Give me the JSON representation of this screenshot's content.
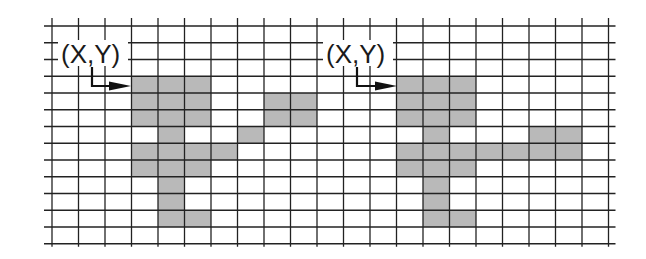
{
  "diagram": {
    "title": "",
    "grid": {
      "columns": 21,
      "rows": 13,
      "origin_x": 52,
      "origin_y": 26,
      "cell_width": 26.5,
      "cell_height": 16.75,
      "line_extend_left": 8,
      "line_extend_right": 7,
      "line_extend_top": 8,
      "line_extend_bottom": 3,
      "line_color": "#222222",
      "fill_color": "#b9b9b9"
    },
    "shapes": [
      {
        "name": "left-shape",
        "label": "(X,Y)",
        "label_x": 61,
        "label_y": 63,
        "label_box": [
          58,
          40,
          70,
          26
        ],
        "arrow": {
          "start": [
            92,
            67
          ],
          "corner": [
            92,
            86
          ],
          "end": [
            131,
            86
          ]
        },
        "cells": [
          [
            3,
            3
          ],
          [
            4,
            3
          ],
          [
            5,
            3
          ],
          [
            3,
            4
          ],
          [
            4,
            4
          ],
          [
            5,
            4
          ],
          [
            8,
            4
          ],
          [
            9,
            4
          ],
          [
            3,
            5
          ],
          [
            4,
            5
          ],
          [
            5,
            5
          ],
          [
            8,
            5
          ],
          [
            9,
            5
          ],
          [
            4,
            6
          ],
          [
            7,
            6
          ],
          [
            3,
            7
          ],
          [
            4,
            7
          ],
          [
            5,
            7
          ],
          [
            6,
            7
          ],
          [
            3,
            8
          ],
          [
            4,
            8
          ],
          [
            5,
            8
          ],
          [
            4,
            9
          ],
          [
            4,
            10
          ],
          [
            4,
            11
          ],
          [
            5,
            11
          ]
        ]
      },
      {
        "name": "right-shape",
        "label": "(X,Y)",
        "label_x": 326,
        "label_y": 63,
        "label_box": [
          323,
          40,
          70,
          26
        ],
        "arrow": {
          "start": [
            357,
            67
          ],
          "corner": [
            357,
            86
          ],
          "end": [
            397,
            86
          ]
        },
        "cells": [
          [
            13,
            3
          ],
          [
            14,
            3
          ],
          [
            15,
            3
          ],
          [
            13,
            4
          ],
          [
            14,
            4
          ],
          [
            15,
            4
          ],
          [
            13,
            5
          ],
          [
            14,
            5
          ],
          [
            15,
            5
          ],
          [
            14,
            6
          ],
          [
            18,
            6
          ],
          [
            19,
            6
          ],
          [
            13,
            7
          ],
          [
            14,
            7
          ],
          [
            15,
            7
          ],
          [
            16,
            7
          ],
          [
            17,
            7
          ],
          [
            18,
            7
          ],
          [
            19,
            7
          ],
          [
            13,
            8
          ],
          [
            14,
            8
          ],
          [
            15,
            8
          ],
          [
            14,
            9
          ],
          [
            14,
            10
          ],
          [
            14,
            11
          ],
          [
            15,
            11
          ]
        ]
      }
    ]
  },
  "chart_data": {
    "type": "heatmap",
    "title": "",
    "xlabel": "",
    "ylabel": "",
    "grid_columns": 21,
    "grid_rows": 13,
    "annotations": [
      {
        "text": "(X,Y)",
        "points_to_cell": [
          3,
          3
        ],
        "arrow": "right"
      },
      {
        "text": "(X,Y)",
        "points_to_cell": [
          13,
          3
        ],
        "arrow": "right"
      }
    ],
    "series": [
      {
        "name": "left-shape",
        "filled_cells_col_row": [
          [
            3,
            3
          ],
          [
            4,
            3
          ],
          [
            5,
            3
          ],
          [
            3,
            4
          ],
          [
            4,
            4
          ],
          [
            5,
            4
          ],
          [
            8,
            4
          ],
          [
            9,
            4
          ],
          [
            3,
            5
          ],
          [
            4,
            5
          ],
          [
            5,
            5
          ],
          [
            8,
            5
          ],
          [
            9,
            5
          ],
          [
            4,
            6
          ],
          [
            7,
            6
          ],
          [
            3,
            7
          ],
          [
            4,
            7
          ],
          [
            5,
            7
          ],
          [
            6,
            7
          ],
          [
            3,
            8
          ],
          [
            4,
            8
          ],
          [
            5,
            8
          ],
          [
            4,
            9
          ],
          [
            4,
            10
          ],
          [
            4,
            11
          ],
          [
            5,
            11
          ]
        ]
      },
      {
        "name": "right-shape",
        "filled_cells_col_row": [
          [
            13,
            3
          ],
          [
            14,
            3
          ],
          [
            15,
            3
          ],
          [
            13,
            4
          ],
          [
            14,
            4
          ],
          [
            15,
            4
          ],
          [
            13,
            5
          ],
          [
            14,
            5
          ],
          [
            15,
            5
          ],
          [
            14,
            6
          ],
          [
            18,
            6
          ],
          [
            19,
            6
          ],
          [
            13,
            7
          ],
          [
            14,
            7
          ],
          [
            15,
            7
          ],
          [
            16,
            7
          ],
          [
            17,
            7
          ],
          [
            18,
            7
          ],
          [
            19,
            7
          ],
          [
            13,
            8
          ],
          [
            14,
            8
          ],
          [
            15,
            8
          ],
          [
            14,
            9
          ],
          [
            14,
            10
          ],
          [
            14,
            11
          ],
          [
            15,
            11
          ]
        ]
      }
    ]
  }
}
